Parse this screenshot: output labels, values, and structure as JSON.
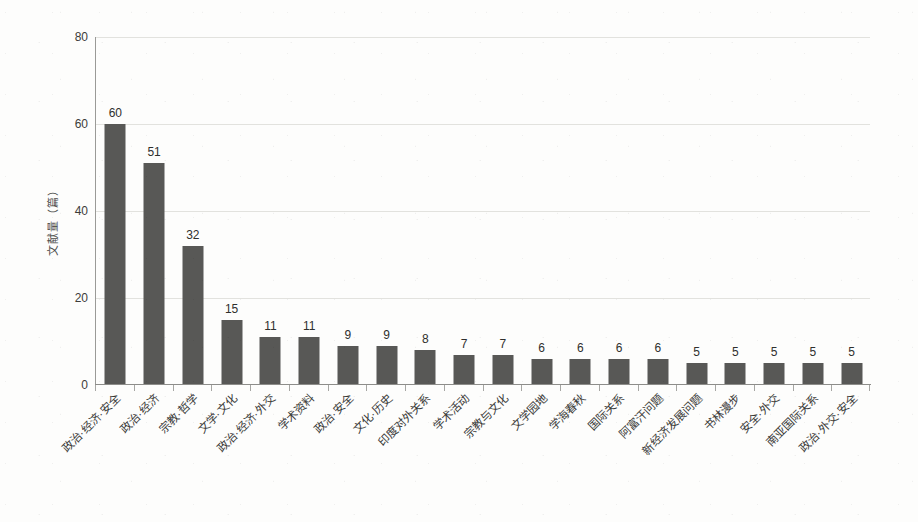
{
  "chart_data": {
    "type": "bar",
    "title": "",
    "xlabel": "",
    "ylabel": "文献量（篇）",
    "ylim": [
      0,
      80
    ],
    "ytick_labels": [
      "0",
      "20",
      "40",
      "60",
      "80"
    ],
    "ytick_values": [
      0,
      20,
      40,
      60,
      80
    ],
    "grid": true,
    "grid_axis": "y",
    "legend": false,
    "bar_color": "#585856",
    "show_value_labels": true,
    "categories": [
      "政治·经济·安全",
      "政治·经济",
      "宗教·哲学",
      "文学·文化",
      "政治·经济·外交",
      "学术资料",
      "政治·安全",
      "文化·历史",
      "印度对外关系",
      "学术活动",
      "宗教与文化",
      "文学园地",
      "学海春秋",
      "国际关系",
      "阿富汗问题",
      "新经济发展问题",
      "书林漫步",
      "安全·外交",
      "南亚国际关系",
      "政治·外交·安全"
    ],
    "values": [
      60,
      51,
      32,
      15,
      11,
      11,
      9,
      9,
      8,
      7,
      7,
      6,
      6,
      6,
      6,
      5,
      5,
      5,
      5,
      5
    ],
    "value_labels": [
      "60",
      "51",
      "32",
      "15",
      "11",
      "11",
      "9",
      "9",
      "8",
      "7",
      "7",
      "6",
      "6",
      "6",
      "6",
      "5",
      "5",
      "5",
      "5",
      "5"
    ]
  }
}
